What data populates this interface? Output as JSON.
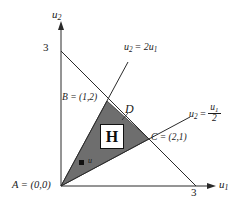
{
  "figure": {
    "type": "geometry-diagram",
    "background_color": "#ffffff",
    "axes": {
      "y_axis_label": "u",
      "y_axis_label_sub": "2",
      "x_axis_label": "u",
      "x_axis_label_sub": "1",
      "y_tick_label": "3",
      "x_tick_label": "3",
      "y_tick_value": 3,
      "x_tick_value": 3,
      "origin_pixel": [
        61,
        186
      ],
      "unit_pixels_per_unit": 45
    },
    "points": [
      {
        "name": "A",
        "label": "A = (0,0)",
        "coords": [
          0,
          0
        ]
      },
      {
        "name": "B",
        "label": "B = (1,2)",
        "coords": [
          1,
          2
        ]
      },
      {
        "name": "C",
        "label": "C = (2,1)",
        "coords": [
          2,
          1
        ]
      },
      {
        "name": "D",
        "label": "D",
        "coords": [
          1.5,
          1.5
        ]
      }
    ],
    "region": {
      "fill_label": "H",
      "fill_color": "#6e6e6e",
      "vertices": [
        "A",
        "B",
        "C"
      ]
    },
    "interior_point": {
      "label": "u",
      "marker": "filled-square"
    },
    "lines": [
      {
        "name": "steep-ray",
        "label_prefix": "u",
        "label_prefix_sub": "2",
        "label_eq": "= 2u",
        "label_eq_sub": "1",
        "equation": "u2 = 2u1",
        "slope": 2
      },
      {
        "name": "shallow-ray",
        "label_prefix": "u",
        "label_prefix_sub": "2",
        "label_eq": "=",
        "numerator": "u",
        "numerator_sub": "1",
        "denominator": "2",
        "equation": "u2 = u1/2",
        "slope": 0.5
      },
      {
        "name": "budget-line",
        "equation": "u1 + u2 = 3",
        "from": [
          0,
          3
        ],
        "to": [
          3,
          0
        ]
      }
    ],
    "colors": {
      "ink": "#1a1a1a",
      "shade": "#6e6e6e",
      "shade_edge": "#5a5a5a",
      "white": "#ffffff"
    }
  }
}
